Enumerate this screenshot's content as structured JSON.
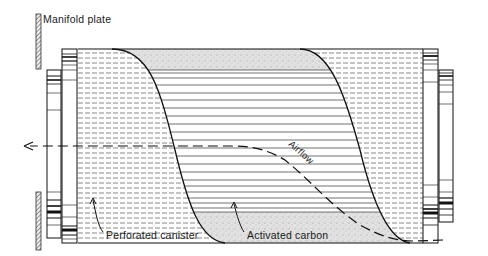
{
  "diagram": {
    "type": "technical cross-section",
    "labels": {
      "manifold_plate": "Manifold plate",
      "perforated_canister": "Perforated canister",
      "activated_carbon": "Activated carbon",
      "airflow": "Airflow"
    },
    "colors": {
      "line": "#1a1a1a",
      "carbon_fill": "#d9d9d9",
      "background": "#ffffff",
      "hatch": "#555555"
    }
  }
}
